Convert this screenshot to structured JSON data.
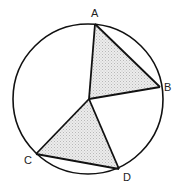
{
  "diagram": {
    "type": "circle-with-inscribed-triangles",
    "circle": {
      "cx": 88,
      "cy": 99,
      "r": 75
    },
    "center": {
      "x": 89,
      "y": 99
    },
    "points": {
      "A": {
        "x": 95,
        "y": 24
      },
      "B": {
        "x": 160,
        "y": 87
      },
      "C": {
        "x": 36,
        "y": 154
      },
      "D": {
        "x": 119,
        "y": 169
      }
    },
    "labels": {
      "A": "A",
      "B": "B",
      "C": "C",
      "D": "D"
    },
    "shaded_triangles": [
      "OAB",
      "OCD"
    ],
    "colors": {
      "stroke": "#111111",
      "shade": "#d8d8d8",
      "background": "#ffffff"
    }
  }
}
